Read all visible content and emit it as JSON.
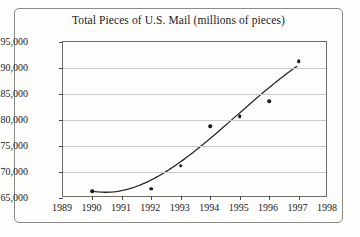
{
  "chart_data": {
    "type": "scatter",
    "title": "Total Pieces of U.S. Mail (millions of pieces)",
    "xlabel": "",
    "ylabel": "",
    "x": [
      1990,
      1992,
      1993,
      1994,
      1995,
      1996,
      1997
    ],
    "values": [
      166300,
      166800,
      171200,
      178800,
      180700,
      183600,
      191300
    ],
    "series": [
      {
        "name": "Total Pieces of U.S. Mail",
        "values": [
          166300,
          166800,
          171200,
          178800,
          180700,
          183600,
          191300
        ]
      }
    ],
    "xlim": [
      1989,
      1998
    ],
    "ylim": [
      165000,
      195000
    ],
    "xticks": [
      1989,
      1990,
      1991,
      1992,
      1993,
      1994,
      1995,
      1996,
      1997,
      1998
    ],
    "xtick_labels": [
      "1989",
      "1990",
      "1991",
      "1992",
      "1993",
      "1994",
      "1995",
      "1996",
      "1997",
      "1998"
    ],
    "yticks": [
      165000,
      170000,
      175000,
      180000,
      185000,
      190000,
      195000
    ],
    "ytick_labels": [
      "165,000",
      "170,000",
      "175,000",
      "180,000",
      "185,000",
      "190,000",
      "195,000"
    ],
    "grid": true,
    "grid_axis": "y",
    "legend": false,
    "legend_position": "none",
    "trendline": {
      "present": true,
      "style": "smooth-curve",
      "description": "fitted cubic regression curve rising from 1990 through 1997"
    },
    "marker_color": "#1b1a18",
    "curve_color": "#2b2926",
    "grid_color": "#c9c9c6",
    "axis_color": "#6e6c69",
    "background": "#fdfdfb"
  }
}
